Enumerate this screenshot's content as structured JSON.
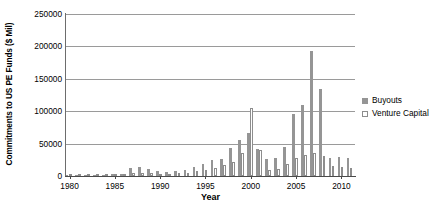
{
  "chart_data": {
    "type": "bar",
    "title": "",
    "xlabel": "Year",
    "ylabel": "Commitments to US PE Funds ($ Mil)",
    "ylim": [
      0,
      250000
    ],
    "ytick_labels": [
      "0",
      "50000",
      "100000",
      "150000",
      "200000",
      "250000"
    ],
    "ytick_values": [
      0,
      50000,
      100000,
      150000,
      200000,
      250000
    ],
    "xtick_labels": [
      "1980",
      "1985",
      "1990",
      "1995",
      "2000",
      "2005",
      "2010"
    ],
    "xtick_values": [
      1980,
      1985,
      1990,
      1995,
      2000,
      2005,
      2010
    ],
    "grid": true,
    "legend_position": "right",
    "categories": [
      1980,
      1981,
      1982,
      1983,
      1984,
      1985,
      1986,
      1987,
      1988,
      1989,
      1990,
      1991,
      1992,
      1993,
      1994,
      1995,
      1996,
      1997,
      1998,
      1999,
      2000,
      2001,
      2002,
      2003,
      2004,
      2005,
      2006,
      2007,
      2008,
      2009,
      2010,
      2011
    ],
    "series": [
      {
        "name": "Buyouts",
        "color": "#959595",
        "values": [
          500,
          600,
          900,
          1400,
          2000,
          2600,
          3500,
          13000,
          14500,
          11000,
          8000,
          6500,
          7000,
          10000,
          14000,
          18000,
          24000,
          27000,
          44000,
          56000,
          67000,
          42000,
          27000,
          28000,
          45000,
          95000,
          110000,
          193000,
          135000,
          28000,
          30000,
          28000
        ]
      },
      {
        "name": "Venture Capital",
        "color": "#ffffff",
        "values": [
          800,
          1200,
          1500,
          3500,
          3500,
          3000,
          3500,
          4500,
          4000,
          4500,
          3500,
          2000,
          5000,
          4500,
          7500,
          9000,
          12000,
          17000,
          22000,
          36000,
          105000,
          40000,
          10000,
          11000,
          19000,
          28000,
          32000,
          35000,
          31000,
          16000,
          14000,
          13000
        ]
      }
    ]
  },
  "legend": {
    "items": [
      {
        "label": "Buyouts",
        "swatch": "filled"
      },
      {
        "label": "Venture Capital",
        "swatch": "hollow"
      }
    ]
  }
}
